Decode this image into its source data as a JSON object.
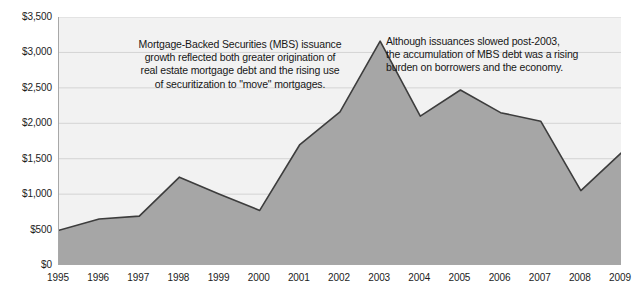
{
  "chart_data": {
    "type": "area",
    "title": "",
    "xlabel": "",
    "ylabel": "",
    "x": [
      1995,
      1996,
      1997,
      1998,
      1999,
      2000,
      2001,
      2002,
      2003,
      2004,
      2005,
      2006,
      2007,
      2008,
      2009
    ],
    "categories": [
      "1995",
      "1996",
      "1997",
      "1998",
      "1999",
      "2000",
      "2001",
      "2002",
      "2003",
      "2004",
      "2005",
      "2006",
      "2007",
      "2008",
      "2009"
    ],
    "values": [
      490,
      650,
      690,
      1240,
      1000,
      770,
      1700,
      2160,
      3160,
      2100,
      2470,
      2150,
      2030,
      1050,
      1580
    ],
    "series": [
      {
        "name": "MBS issuance",
        "values": [
          490,
          650,
          690,
          1240,
          1000,
          770,
          1700,
          2160,
          3160,
          2100,
          2470,
          2150,
          2030,
          1050,
          1580
        ]
      }
    ],
    "ylim": [
      0,
      3500
    ],
    "xlim": [
      1995,
      2009
    ],
    "y_ticks": [
      0,
      500,
      1000,
      1500,
      2000,
      2500,
      3000,
      3500
    ],
    "y_tick_labels": [
      "$0",
      "$500",
      "$1,000",
      "$1,500",
      "$2,000",
      "$2,500",
      "$3,000",
      "$3,500"
    ],
    "x_tick_labels": [
      "1995",
      "1996",
      "1997",
      "1998",
      "1999",
      "2000",
      "2001",
      "2002",
      "2003",
      "2004",
      "2005",
      "2006",
      "2007",
      "2008",
      "2009"
    ],
    "grid": true,
    "legend": "none",
    "colors": {
      "area_fill": "#a6a6a6",
      "area_line": "#3d3d3d",
      "plot_background": "#f2f2f2",
      "gridline": "#d4d4d4",
      "axis_line": "#a8a8a8",
      "text": "#1c1c1c"
    },
    "annotations": [
      {
        "id": "mbs-growth",
        "text": "Mortgage-Backed Securities (MBS) issuance growth reflected both greater origination of real estate mortgage debt and the rising use of securitization to \"move\" mortgages."
      },
      {
        "id": "post-2003",
        "text": "Although issuances slowed post-2003, the accumulation of MBS debt was a rising burden on borrowers and the economy."
      }
    ]
  },
  "annotations": {
    "mbs_growth": "Mortgage-Backed Securities (MBS) issuance\ngrowth reflected both greater origination of\nreal estate mortgage debt and the rising use\nof securitization to \"move\" mortgages.",
    "post_2003": "Although issuances slowed post-2003,\nthe accumulation of MBS debt was a rising\nburden on borrowers and the economy."
  }
}
